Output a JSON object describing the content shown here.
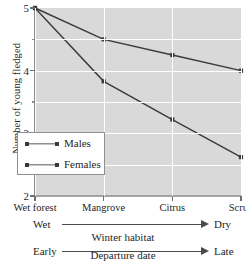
{
  "chart_data": {
    "type": "line",
    "title": "",
    "xlabel": "Winter habitat",
    "ylabel": "Number of young fledged",
    "categories": [
      "Wet forest",
      "Mangrove",
      "Citrus",
      "Scrub"
    ],
    "series": [
      {
        "name": "Males",
        "values": [
          5.0,
          4.5,
          4.25,
          4.0
        ]
      },
      {
        "name": "Females",
        "values": [
          5.0,
          3.83,
          3.22,
          2.62
        ]
      }
    ],
    "ylim": [
      2,
      5
    ],
    "ytick_labels": [
      "2",
      "3",
      "4",
      "5"
    ],
    "ytick_values": [
      2,
      3,
      4,
      5
    ],
    "yminor_values": [
      2.5,
      3.5,
      4.5
    ],
    "grid": true,
    "legend_position": "inside lower left",
    "plot_background_color": "#d9d9d9",
    "gridline_color": "#ffffff",
    "series_color": "#3a3a3a",
    "annotations": [
      {
        "id": "habitat-axis",
        "left_label": "Wet",
        "right_label": "Dry",
        "caption": "Winter habitat"
      },
      {
        "id": "departure-axis",
        "left_label": "Early",
        "right_label": "Late",
        "caption": "Departure date"
      }
    ]
  }
}
